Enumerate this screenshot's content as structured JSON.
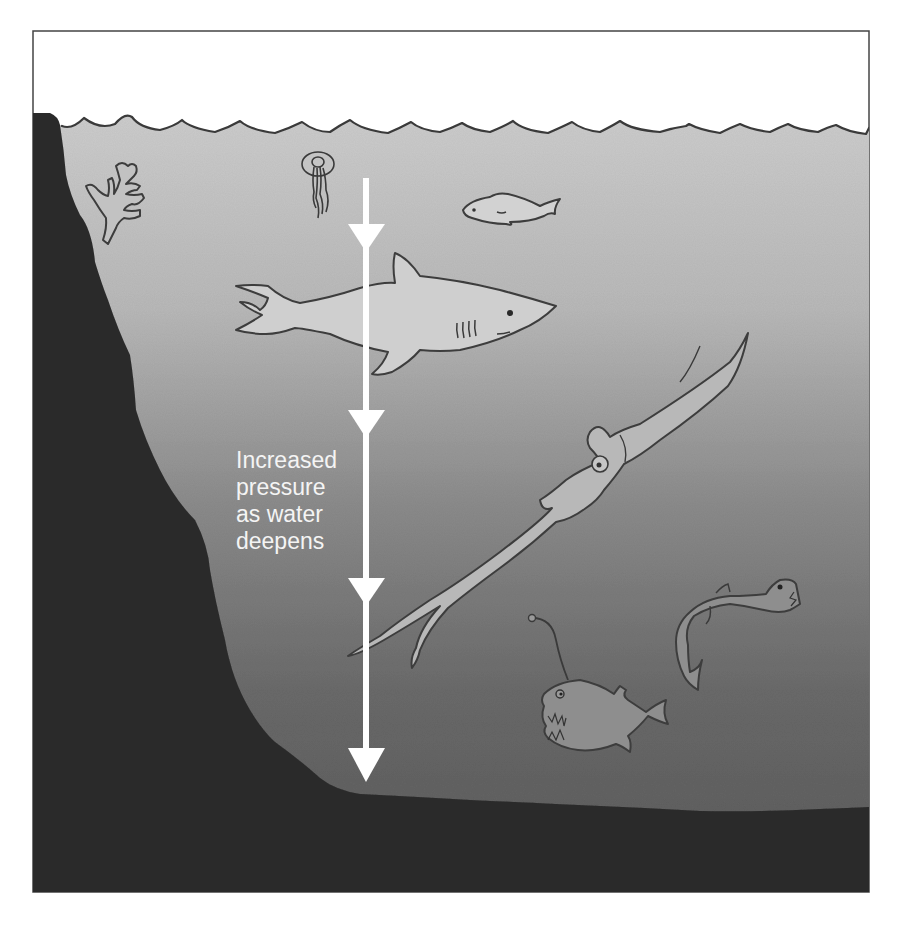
{
  "diagram": {
    "label_lines": [
      "Increased",
      "pressure",
      "as water",
      "deepens"
    ],
    "arrow": {
      "direction": "down",
      "meaning": "pressure increases with depth",
      "arrowhead_count": 4
    },
    "elements": [
      {
        "name": "sea-surface-waves"
      },
      {
        "name": "rock-cliff"
      },
      {
        "name": "sea-floor"
      },
      {
        "name": "coral"
      },
      {
        "name": "jellyfish"
      },
      {
        "name": "small-fish"
      },
      {
        "name": "shark"
      },
      {
        "name": "giant-squid"
      },
      {
        "name": "anglerfish"
      },
      {
        "name": "viperfish"
      }
    ],
    "colors": {
      "sky": "#ffffff",
      "water_top": "#c9c9c9",
      "water_mid": "#8f8f8f",
      "water_deep": "#5f5f5f",
      "rock": "#2f2f2f",
      "outline": "#3a3a3a",
      "arrow": "#ffffff",
      "label": "#f4f4f4"
    }
  }
}
